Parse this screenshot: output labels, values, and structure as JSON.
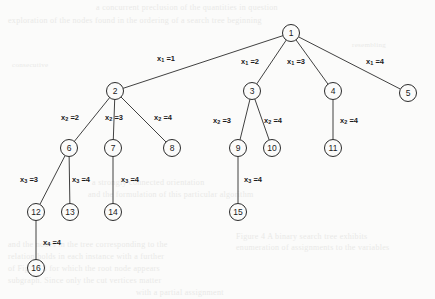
{
  "figure": {
    "type": "tree-diagram",
    "width": 435,
    "height": 299,
    "background_color": "#fbfbfa",
    "ink_color": "#1a1a1a"
  },
  "bleed_through_text": [
    {
      "id": "b1",
      "text": "a concurrent preclusion of the quantities in question",
      "x": 96,
      "y": 3,
      "size": 8
    },
    {
      "id": "b2",
      "text": "exploration of the nodes found in the ordering of a search tree beginning",
      "x": 8,
      "y": 16,
      "size": 8
    },
    {
      "id": "b3",
      "text": "consecutive",
      "x": 12,
      "y": 61,
      "size": 7
    },
    {
      "id": "b4",
      "text": "resembling",
      "x": 352,
      "y": 41,
      "size": 7
    },
    {
      "id": "b5",
      "text": "a strongly connected orientation",
      "x": 92,
      "y": 178,
      "size": 8
    },
    {
      "id": "b6",
      "text": "and the formulation of this particular algorithm",
      "x": 88,
      "y": 190,
      "size": 8
    },
    {
      "id": "b7",
      "text": "Figure 4  A binary search tree exhibits",
      "x": 236,
      "y": 232,
      "size": 8
    },
    {
      "id": "b8",
      "text": "enumeration of assignments to the variables",
      "x": 236,
      "y": 243,
      "size": 8
    },
    {
      "id": "b9",
      "text": "and the nodes in the tree corresponding to the",
      "x": 8,
      "y": 240,
      "size": 8
    },
    {
      "id": "b10",
      "text": "relation holds in each instance with a further",
      "x": 8,
      "y": 252,
      "size": 8
    },
    {
      "id": "b11",
      "text": "of Figure 3 for which the root node appears",
      "x": 8,
      "y": 264,
      "size": 8
    },
    {
      "id": "b12",
      "text": "subgraph. Since only the cut vertices matter",
      "x": 8,
      "y": 276,
      "size": 8
    },
    {
      "id": "b13",
      "text": "with a partial assignment",
      "x": 136,
      "y": 288,
      "size": 8
    }
  ],
  "tree": {
    "node_radius": 8.5,
    "nodes": [
      {
        "id": "n1",
        "label": "1",
        "x": 291,
        "y": 33
      },
      {
        "id": "n2",
        "label": "2",
        "x": 115,
        "y": 91
      },
      {
        "id": "n3",
        "label": "3",
        "x": 252,
        "y": 91
      },
      {
        "id": "n4",
        "label": "4",
        "x": 333,
        "y": 91
      },
      {
        "id": "n5",
        "label": "5",
        "x": 408,
        "y": 93
      },
      {
        "id": "n6",
        "label": "6",
        "x": 69,
        "y": 148
      },
      {
        "id": "n7",
        "label": "7",
        "x": 113,
        "y": 148
      },
      {
        "id": "n8",
        "label": "8",
        "x": 172,
        "y": 148
      },
      {
        "id": "n9",
        "label": "9",
        "x": 238,
        "y": 148
      },
      {
        "id": "n10",
        "label": "10",
        "x": 272,
        "y": 148
      },
      {
        "id": "n11",
        "label": "11",
        "x": 333,
        "y": 148
      },
      {
        "id": "n12",
        "label": "12",
        "x": 36,
        "y": 212
      },
      {
        "id": "n13",
        "label": "13",
        "x": 70,
        "y": 212
      },
      {
        "id": "n14",
        "label": "14",
        "x": 113,
        "y": 212
      },
      {
        "id": "n15",
        "label": "15",
        "x": 238,
        "y": 212
      },
      {
        "id": "n16",
        "label": "16",
        "x": 36,
        "y": 268
      }
    ],
    "edges": [
      {
        "id": "e1",
        "from": "n1",
        "to": "n2",
        "var": "x",
        "sub": "1",
        "value": "1",
        "lx": 166,
        "ly": 59
      },
      {
        "id": "e2",
        "from": "n1",
        "to": "n3",
        "var": "x",
        "sub": "1",
        "value": "2",
        "lx": 250,
        "ly": 62
      },
      {
        "id": "e3",
        "from": "n1",
        "to": "n4",
        "var": "x",
        "sub": "1",
        "value": "3",
        "lx": 296,
        "ly": 62
      },
      {
        "id": "e4",
        "from": "n1",
        "to": "n5",
        "var": "x",
        "sub": "1",
        "value": "4",
        "lx": 375,
        "ly": 62
      },
      {
        "id": "e5",
        "from": "n2",
        "to": "n6",
        "var": "x",
        "sub": "2",
        "value": "2",
        "lx": 70,
        "ly": 118
      },
      {
        "id": "e6",
        "from": "n2",
        "to": "n7",
        "var": "x",
        "sub": "2",
        "value": "3",
        "lx": 114,
        "ly": 118
      },
      {
        "id": "e7",
        "from": "n2",
        "to": "n8",
        "var": "x",
        "sub": "2",
        "value": "4",
        "lx": 163,
        "ly": 118
      },
      {
        "id": "e8",
        "from": "n3",
        "to": "n9",
        "var": "x",
        "sub": "2",
        "value": "3",
        "lx": 222,
        "ly": 121
      },
      {
        "id": "e9",
        "from": "n3",
        "to": "n10",
        "var": "x",
        "sub": "2",
        "value": "4",
        "lx": 273,
        "ly": 121
      },
      {
        "id": "e10",
        "from": "n4",
        "to": "n11",
        "var": "x",
        "sub": "2",
        "value": "4",
        "lx": 349,
        "ly": 121
      },
      {
        "id": "e11",
        "from": "n6",
        "to": "n12",
        "var": "x",
        "sub": "3",
        "value": "3",
        "lx": 29,
        "ly": 180
      },
      {
        "id": "e12",
        "from": "n6",
        "to": "n13",
        "var": "x",
        "sub": "3",
        "value": "4",
        "lx": 81,
        "ly": 180
      },
      {
        "id": "e13",
        "from": "n7",
        "to": "n14",
        "var": "x",
        "sub": "3",
        "value": "4",
        "lx": 130,
        "ly": 180
      },
      {
        "id": "e14",
        "from": "n9",
        "to": "n15",
        "var": "x",
        "sub": "3",
        "value": "4",
        "lx": 253,
        "ly": 180
      },
      {
        "id": "e15",
        "from": "n12",
        "to": "n16",
        "var": "x",
        "sub": "4",
        "value": "4",
        "lx": 52,
        "ly": 243
      }
    ]
  }
}
